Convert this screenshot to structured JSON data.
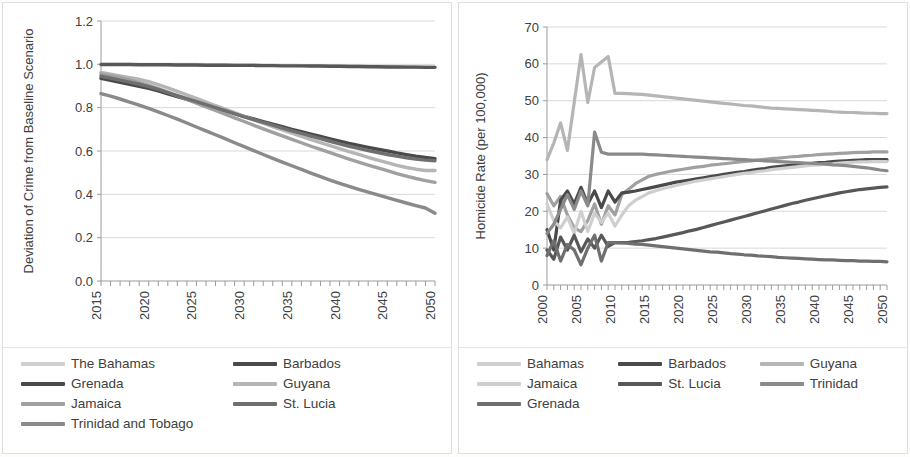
{
  "panels": {
    "left": {
      "name": "deviation-of-crime-chart",
      "legend_columns": 2
    },
    "right": {
      "name": "homicide-rate-chart",
      "legend_columns": 3
    }
  },
  "colors": {
    "very_light_gray": "#cfcfcf",
    "light_gray": "#b5b5b5",
    "medium_light_gray": "#a0a0a0",
    "medium_gray": "#8a8a8a",
    "medium_dark_gray": "#6f6f6f",
    "dark_gray": "#585858",
    "darkest_gray": "#4a4a4a",
    "gridline": "#d9d9d9",
    "axis": "#9b9b9b",
    "text": "#404040",
    "panel_border": "#dedede",
    "background": "#ffffff"
  },
  "chart_data": [
    {
      "type": "line",
      "name": "deviation-of-crime-from-baseline-scenario",
      "title": "",
      "xlabel": "",
      "ylabel": "Deviation of Crime from Baseline Scenario",
      "xlim": [
        2015,
        2050
      ],
      "ylim": [
        0.0,
        1.2
      ],
      "yticks": [
        "0.0",
        "0.2",
        "0.4",
        "0.6",
        "0.8",
        "1.0",
        "1.2"
      ],
      "ytick_values": [
        0.0,
        0.2,
        0.4,
        0.6,
        0.8,
        1.0,
        1.2
      ],
      "xticks": [
        "2015",
        "2020",
        "2025",
        "2030",
        "2035",
        "2040",
        "2045",
        "2050"
      ],
      "xtick_values": [
        2015,
        2020,
        2025,
        2030,
        2035,
        2040,
        2045,
        2050
      ],
      "minor_xtick_interval": 1,
      "grid": "horizontal",
      "legend_position": "below",
      "x": [
        2015,
        2016,
        2017,
        2018,
        2019,
        2020,
        2021,
        2022,
        2023,
        2024,
        2025,
        2026,
        2027,
        2028,
        2029,
        2030,
        2031,
        2032,
        2033,
        2034,
        2035,
        2036,
        2037,
        2038,
        2039,
        2040,
        2041,
        2042,
        2043,
        2044,
        2045,
        2046,
        2047,
        2048,
        2049,
        2050
      ],
      "series": [
        {
          "name": "The Bahamas",
          "color": "#cfcfcf",
          "values": [
            1.0,
            1.0,
            1.0,
            1.0,
            1.0,
            1.0,
            1.0,
            0.999,
            0.999,
            0.999,
            0.999,
            0.998,
            0.998,
            0.998,
            0.997,
            0.997,
            0.997,
            0.996,
            0.996,
            0.995,
            0.995,
            0.994,
            0.994,
            0.993,
            0.993,
            0.992,
            0.992,
            0.991,
            0.991,
            0.99,
            0.99,
            0.989,
            0.989,
            0.988,
            0.988,
            0.987
          ]
        },
        {
          "name": "Barbados",
          "color": "#585858",
          "values": [
            0.999,
            0.999,
            0.999,
            0.999,
            0.998,
            0.998,
            0.998,
            0.998,
            0.997,
            0.997,
            0.997,
            0.996,
            0.996,
            0.996,
            0.995,
            0.995,
            0.995,
            0.994,
            0.994,
            0.993,
            0.993,
            0.993,
            0.992,
            0.992,
            0.991,
            0.991,
            0.99,
            0.99,
            0.989,
            0.989,
            0.988,
            0.988,
            0.987,
            0.987,
            0.986,
            0.986
          ]
        },
        {
          "name": "Grenada",
          "color": "#4a4a4a",
          "values": [
            0.935,
            0.926,
            0.917,
            0.908,
            0.899,
            0.889,
            0.877,
            0.864,
            0.851,
            0.838,
            0.825,
            0.812,
            0.799,
            0.786,
            0.773,
            0.76,
            0.748,
            0.736,
            0.724,
            0.712,
            0.7,
            0.689,
            0.678,
            0.667,
            0.656,
            0.645,
            0.635,
            0.626,
            0.617,
            0.608,
            0.6,
            0.591,
            0.583,
            0.576,
            0.57,
            0.565
          ]
        },
        {
          "name": "Guyana",
          "color": "#b5b5b5",
          "values": [
            0.963,
            0.955,
            0.947,
            0.939,
            0.931,
            0.92,
            0.906,
            0.891,
            0.875,
            0.859,
            0.843,
            0.826,
            0.81,
            0.793,
            0.777,
            0.76,
            0.744,
            0.728,
            0.713,
            0.698,
            0.683,
            0.668,
            0.653,
            0.639,
            0.625,
            0.611,
            0.597,
            0.584,
            0.571,
            0.558,
            0.546,
            0.534,
            0.524,
            0.516,
            0.51,
            0.51
          ]
        },
        {
          "name": "Jamaica",
          "color": "#a0a0a0",
          "values": [
            0.955,
            0.947,
            0.938,
            0.928,
            0.916,
            0.903,
            0.888,
            0.872,
            0.855,
            0.838,
            0.821,
            0.804,
            0.787,
            0.77,
            0.753,
            0.736,
            0.719,
            0.702,
            0.686,
            0.67,
            0.654,
            0.638,
            0.622,
            0.607,
            0.592,
            0.577,
            0.563,
            0.549,
            0.535,
            0.522,
            0.509,
            0.496,
            0.484,
            0.473,
            0.463,
            0.455
          ]
        },
        {
          "name": "St. Lucia",
          "color": "#6f6f6f",
          "values": [
            0.945,
            0.936,
            0.927,
            0.918,
            0.908,
            0.897,
            0.884,
            0.87,
            0.856,
            0.842,
            0.828,
            0.814,
            0.8,
            0.786,
            0.772,
            0.758,
            0.745,
            0.732,
            0.719,
            0.706,
            0.693,
            0.681,
            0.669,
            0.657,
            0.645,
            0.633,
            0.622,
            0.612,
            0.602,
            0.593,
            0.584,
            0.576,
            0.569,
            0.563,
            0.558,
            0.555
          ]
        },
        {
          "name": "Trinidad and Tobago",
          "color": "#8a8a8a",
          "values": [
            0.865,
            0.853,
            0.84,
            0.826,
            0.812,
            0.797,
            0.781,
            0.764,
            0.747,
            0.729,
            0.711,
            0.693,
            0.675,
            0.657,
            0.638,
            0.62,
            0.602,
            0.584,
            0.566,
            0.549,
            0.532,
            0.515,
            0.498,
            0.482,
            0.466,
            0.451,
            0.437,
            0.423,
            0.41,
            0.397,
            0.385,
            0.372,
            0.36,
            0.348,
            0.337,
            0.313
          ]
        }
      ]
    },
    {
      "type": "line",
      "name": "homicide-rate-per-100000",
      "title": "",
      "xlabel": "",
      "ylabel": "Homicide Rate (per 100,000)",
      "xlim": [
        2000,
        2050
      ],
      "ylim": [
        0,
        70
      ],
      "yticks": [
        "0",
        "10",
        "20",
        "30",
        "40",
        "50",
        "60",
        "70"
      ],
      "ytick_values": [
        0,
        10,
        20,
        30,
        40,
        50,
        60,
        70
      ],
      "xticks": [
        "2000",
        "2005",
        "2010",
        "2015",
        "2020",
        "2025",
        "2030",
        "2035",
        "2040",
        "2045",
        "2050"
      ],
      "xtick_values": [
        2000,
        2005,
        2010,
        2015,
        2020,
        2025,
        2030,
        2035,
        2040,
        2045,
        2050
      ],
      "minor_xtick_interval": 1,
      "grid": "horizontal",
      "legend_position": "below",
      "x": [
        2000,
        2001,
        2002,
        2003,
        2004,
        2005,
        2006,
        2007,
        2008,
        2009,
        2010,
        2011,
        2012,
        2013,
        2014,
        2015,
        2016,
        2017,
        2018,
        2019,
        2020,
        2021,
        2022,
        2023,
        2024,
        2025,
        2026,
        2027,
        2028,
        2029,
        2030,
        2031,
        2032,
        2033,
        2034,
        2035,
        2036,
        2037,
        2038,
        2039,
        2040,
        2041,
        2042,
        2043,
        2044,
        2045,
        2046,
        2047,
        2048,
        2049,
        2050
      ],
      "series": [
        {
          "name": "Bahamas",
          "color": "#a0a0a0",
          "values": [
            24.8,
            21.5,
            24.0,
            19.0,
            15.5,
            14.5,
            17.5,
            22.0,
            16.5,
            21.5,
            19.0,
            24.5,
            26.0,
            27.5,
            28.5,
            29.5,
            30.0,
            30.4,
            30.8,
            31.1,
            31.4,
            31.7,
            32.0,
            32.2,
            32.5,
            32.7,
            32.9,
            33.1,
            33.3,
            33.5,
            33.7,
            33.9,
            34.1,
            34.3,
            34.4,
            34.6,
            34.8,
            34.9,
            35.1,
            35.2,
            35.4,
            35.5,
            35.6,
            35.7,
            35.8,
            35.9,
            36.0,
            36.0,
            36.1,
            36.1,
            36.1
          ]
        },
        {
          "name": "Barbados",
          "color": "#4a4a4a",
          "values": [
            15.0,
            9.5,
            23.0,
            25.5,
            22.0,
            26.5,
            22.0,
            25.5,
            21.0,
            25.5,
            22.5,
            25.0,
            25.2,
            25.5,
            25.9,
            26.3,
            26.7,
            27.1,
            27.5,
            27.9,
            28.2,
            28.5,
            28.8,
            29.1,
            29.4,
            29.7,
            30.0,
            30.3,
            30.6,
            30.8,
            31.1,
            31.4,
            31.6,
            31.9,
            32.1,
            32.3,
            32.5,
            32.7,
            32.9,
            33.0,
            33.2,
            33.3,
            33.5,
            33.6,
            33.7,
            33.8,
            33.9,
            34.0,
            34.0,
            34.0,
            34.0
          ]
        },
        {
          "name": "Guyana",
          "color": "#b5b5b5",
          "values": [
            34.0,
            38.5,
            44.0,
            36.5,
            49.5,
            62.5,
            49.5,
            59.0,
            60.5,
            62.0,
            52.0,
            52.0,
            51.9,
            51.8,
            51.7,
            51.5,
            51.3,
            51.1,
            50.9,
            50.7,
            50.5,
            50.3,
            50.1,
            49.9,
            49.7,
            49.5,
            49.3,
            49.1,
            48.9,
            48.7,
            48.6,
            48.4,
            48.2,
            48.0,
            47.9,
            47.8,
            47.7,
            47.6,
            47.5,
            47.4,
            47.3,
            47.2,
            47.0,
            46.9,
            46.8,
            46.8,
            46.7,
            46.6,
            46.6,
            46.5,
            46.5
          ]
        },
        {
          "name": "Jamaica",
          "color": "#cfcfcf",
          "values": [
            22.0,
            17.5,
            15.5,
            18.5,
            14.0,
            20.0,
            14.5,
            19.5,
            17.0,
            19.5,
            16.0,
            19.0,
            21.5,
            23.0,
            24.0,
            25.0,
            25.6,
            26.1,
            26.6,
            27.0,
            27.4,
            27.8,
            28.2,
            28.5,
            28.8,
            29.1,
            29.4,
            29.7,
            30.0,
            30.3,
            30.5,
            30.8,
            31.0,
            31.3,
            31.5,
            31.7,
            31.9,
            32.1,
            32.3,
            32.5,
            32.6,
            32.8,
            32.9,
            33.1,
            33.2,
            33.3,
            33.4,
            33.4,
            33.5,
            33.5,
            33.5
          ]
        },
        {
          "name": "St. Lucia",
          "color": "#585858",
          "values": [
            9.5,
            7.0,
            13.0,
            9.5,
            13.5,
            9.0,
            12.5,
            10.0,
            13.5,
            10.5,
            11.5,
            11.5,
            11.6,
            11.8,
            12.0,
            12.3,
            12.6,
            13.0,
            13.4,
            13.8,
            14.2,
            14.7,
            15.1,
            15.6,
            16.1,
            16.6,
            17.1,
            17.6,
            18.1,
            18.6,
            19.1,
            19.6,
            20.1,
            20.6,
            21.1,
            21.6,
            22.1,
            22.5,
            23.0,
            23.4,
            23.8,
            24.2,
            24.6,
            25.0,
            25.3,
            25.6,
            25.9,
            26.1,
            26.3,
            26.5,
            26.6
          ]
        },
        {
          "name": "Trinidad",
          "color": "#8a8a8a",
          "values": [
            14.0,
            16.5,
            20.5,
            24.5,
            20.5,
            25.5,
            21.5,
            41.5,
            36.0,
            35.5,
            35.5,
            35.5,
            35.5,
            35.5,
            35.5,
            35.4,
            35.3,
            35.2,
            35.1,
            35.0,
            34.9,
            34.8,
            34.7,
            34.6,
            34.5,
            34.4,
            34.3,
            34.2,
            34.1,
            34.0,
            33.9,
            33.8,
            33.7,
            33.6,
            33.5,
            33.4,
            33.3,
            33.2,
            33.1,
            33.0,
            32.9,
            32.8,
            32.6,
            32.5,
            32.4,
            32.2,
            32.0,
            31.8,
            31.5,
            31.2,
            31.0
          ]
        },
        {
          "name": "Grenada",
          "color": "#6f6f6f",
          "values": [
            8.0,
            12.0,
            6.5,
            11.0,
            9.5,
            5.5,
            10.0,
            13.5,
            6.5,
            11.5,
            11.5,
            11.4,
            11.3,
            11.1,
            11.0,
            10.8,
            10.6,
            10.4,
            10.2,
            10.0,
            9.8,
            9.6,
            9.4,
            9.2,
            9.0,
            8.9,
            8.7,
            8.5,
            8.4,
            8.2,
            8.1,
            7.9,
            7.8,
            7.7,
            7.5,
            7.4,
            7.3,
            7.2,
            7.1,
            7.0,
            6.9,
            6.8,
            6.8,
            6.7,
            6.6,
            6.6,
            6.5,
            6.5,
            6.4,
            6.4,
            6.3
          ]
        }
      ]
    }
  ],
  "legend_left": {
    "rows": [
      [
        {
          "label": "The Bahamas",
          "color": "#cfcfcf"
        },
        {
          "label": "Barbados",
          "color": "#4a4a4a"
        }
      ],
      [
        {
          "label": "Grenada",
          "color": "#4a4a4a"
        },
        {
          "label": "Guyana",
          "color": "#b5b5b5"
        }
      ],
      [
        {
          "label": "Jamaica",
          "color": "#a0a0a0"
        },
        {
          "label": "St. Lucia",
          "color": "#6f6f6f"
        }
      ],
      [
        {
          "label": "Trinidad and Tobago",
          "color": "#8a8a8a"
        }
      ]
    ]
  },
  "legend_right": {
    "rows": [
      [
        {
          "label": "Bahamas",
          "color": "#cfcfcf"
        },
        {
          "label": "Barbados",
          "color": "#4a4a4a"
        },
        {
          "label": "Guyana",
          "color": "#b5b5b5"
        }
      ],
      [
        {
          "label": "Jamaica",
          "color": "#cfcfcf"
        },
        {
          "label": "St. Lucia",
          "color": "#585858"
        },
        {
          "label": "Trinidad",
          "color": "#8a8a8a"
        }
      ],
      [
        {
          "label": "Grenada",
          "color": "#6f6f6f"
        }
      ]
    ]
  }
}
